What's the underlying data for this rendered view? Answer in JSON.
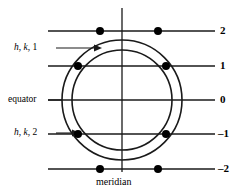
{
  "figure": {
    "background_color": "#ffffff",
    "line_color": "#1a1a1a",
    "dot_color": "#000000",
    "center": {
      "x": 122,
      "y": 100
    },
    "circles": [
      {
        "name": "outer-circle",
        "label_ref": "h, k, 2",
        "radius": 60
      },
      {
        "name": "inner-circle",
        "label_ref": "h, k, 1",
        "radius": 50
      }
    ],
    "meridian": {
      "label": "meridian",
      "x": 122,
      "y_top": 8,
      "y_bottom": 172
    },
    "equator": {
      "label": "equator",
      "y": 100
    }
  },
  "axis_labels": [
    {
      "value": "2",
      "y": 31
    },
    {
      "value": "1",
      "y": 66
    },
    {
      "value": "0",
      "y": 100
    },
    {
      "value": "–1",
      "y": 134
    },
    {
      "value": "–2",
      "y": 169
    }
  ],
  "layer_lines": [
    {
      "level": "2",
      "y": 31,
      "x_start": 48,
      "x_end": 215
    },
    {
      "level": "1",
      "y": 66,
      "x_start": 48,
      "x_end": 215
    },
    {
      "level": "0",
      "y": 100,
      "x_start": 48,
      "x_end": 215
    },
    {
      "level": "-1",
      "y": 134,
      "x_start": 48,
      "x_end": 215
    },
    {
      "level": "-2",
      "y": 169,
      "x_start": 48,
      "x_end": 215
    }
  ],
  "annotations": {
    "equator": {
      "text": "equator",
      "x": 8,
      "y": 96
    },
    "meridian": {
      "text": "meridian",
      "x": 98,
      "y": 178
    },
    "hk1": {
      "text_h": "h",
      "text_k": "k",
      "text_l": "1",
      "full": "h, k, 1",
      "x": 14,
      "y": 43,
      "arrow_from_x": 56,
      "arrow_to_x": 100,
      "arrow_y": 48
    },
    "hk2": {
      "text_h": "h",
      "text_k": "k",
      "text_l": "2",
      "full": "h, k, 2",
      "x": 14,
      "y": 128,
      "arrow_from_x": 56,
      "arrow_to_x": 80,
      "arrow_y": 133
    }
  },
  "reflections": [
    {
      "name": "dot-l2-left",
      "layer": "2",
      "circle": "outer",
      "x": 100,
      "y": 31
    },
    {
      "name": "dot-l2-right",
      "layer": "2",
      "circle": "outer",
      "x": 158,
      "y": 31
    },
    {
      "name": "dot-l1-left",
      "layer": "1",
      "circle": "inner",
      "x": 78,
      "y": 66
    },
    {
      "name": "dot-l1-right",
      "layer": "1",
      "circle": "inner",
      "x": 166,
      "y": 66
    },
    {
      "name": "dot-lm1-left",
      "layer": "-1",
      "circle": "inner",
      "x": 78,
      "y": 134
    },
    {
      "name": "dot-lm1-right",
      "layer": "-1",
      "circle": "inner",
      "x": 166,
      "y": 134
    },
    {
      "name": "dot-lm2-left",
      "layer": "-2",
      "circle": "outer",
      "x": 100,
      "y": 169
    },
    {
      "name": "dot-lm2-right",
      "layer": "-2",
      "circle": "outer",
      "x": 158,
      "y": 169
    }
  ]
}
